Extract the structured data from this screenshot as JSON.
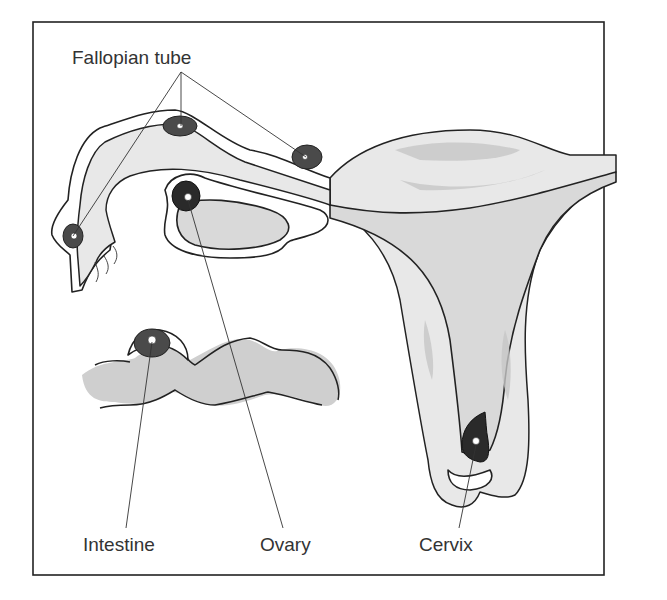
{
  "figure": {
    "type": "anatomical-illustration"
  },
  "labels": {
    "fallopian_tube": "Fallopian tube",
    "intestine": "Intestine",
    "ovary": "Ovary",
    "cervix": "Cervix"
  },
  "colors": {
    "frame": "#222222",
    "tissue": "#d9d9d9",
    "implant": "#4a4a4a",
    "implant_dark": "#2a2a2a",
    "label_text": "#333333"
  }
}
